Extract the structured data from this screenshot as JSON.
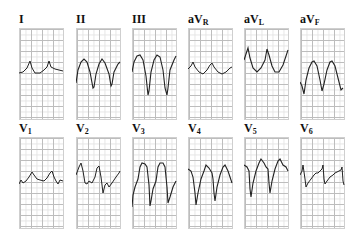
{
  "figure": {
    "type": "12-lead ECG strips",
    "rows": [
      {
        "leads": [
          {
            "id": "I",
            "name": "I",
            "sub": ""
          },
          {
            "id": "II",
            "name": "II",
            "sub": ""
          },
          {
            "id": "III",
            "name": "III",
            "sub": ""
          },
          {
            "id": "aVR",
            "name": "aV",
            "sub": "R"
          },
          {
            "id": "aVL",
            "name": "aV",
            "sub": "L"
          },
          {
            "id": "aVF",
            "name": "aV",
            "sub": "F"
          }
        ]
      },
      {
        "leads": [
          {
            "id": "V1",
            "name": "V",
            "sub": "1"
          },
          {
            "id": "V2",
            "name": "V",
            "sub": "2"
          },
          {
            "id": "V3",
            "name": "V",
            "sub": "3"
          },
          {
            "id": "V4",
            "name": "V",
            "sub": "4"
          },
          {
            "id": "V5",
            "name": "V",
            "sub": "5"
          },
          {
            "id": "V6",
            "name": "V",
            "sub": "6"
          }
        ]
      }
    ],
    "trace_color": "#222222",
    "grid_major_color": "#bdbdbd",
    "grid_minor_color": "#e4e4e4"
  }
}
